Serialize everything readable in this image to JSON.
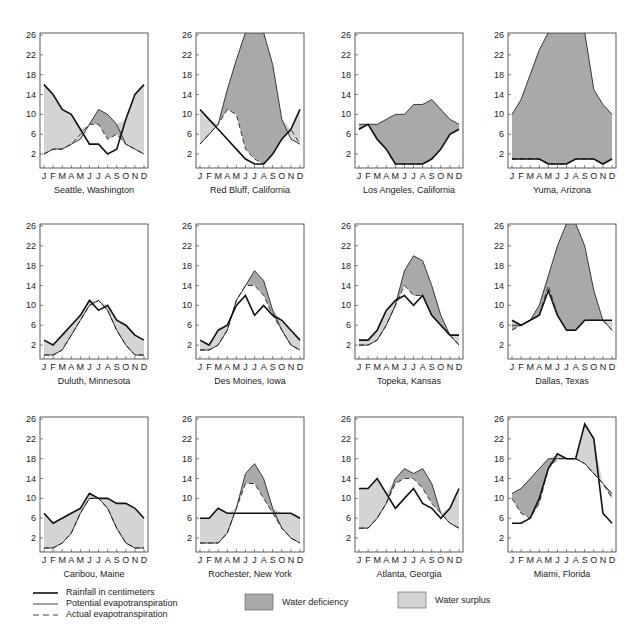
{
  "chart_data": {
    "type": "line",
    "x": [
      "J",
      "F",
      "M",
      "A",
      "M",
      "J",
      "J",
      "A",
      "S",
      "O",
      "N",
      "D"
    ],
    "ylim": [
      0,
      26
    ],
    "yticks": [
      2,
      6,
      10,
      14,
      18,
      22,
      26
    ],
    "legend": {
      "rainfall": "Rainfall in centimeters",
      "potential": "Potential evapotranspiration",
      "actual": "Actual evapotranspiration",
      "deficiency": "Water deficiency",
      "surplus": "Water surplus"
    },
    "colors": {
      "deficiency": "#a9a9a9",
      "surplus": "#d4d4d4",
      "line": "#111111"
    },
    "panels": [
      {
        "name": "Seattle, Washington",
        "rainfall": [
          16,
          14,
          11,
          10,
          7,
          4,
          4,
          2,
          3,
          9,
          14,
          16
        ],
        "potential": [
          2,
          3,
          3,
          4,
          5,
          8,
          11,
          10,
          8,
          4,
          3,
          2
        ],
        "actual": [
          2,
          3,
          3,
          4,
          6,
          8,
          8,
          5,
          6,
          4,
          3,
          2
        ]
      },
      {
        "name": "Red Bluff, California",
        "rainfall": [
          11,
          9,
          7,
          5,
          3,
          1,
          0,
          0,
          2,
          5,
          7,
          11
        ],
        "potential": [
          4,
          6,
          8,
          15,
          21,
          29,
          30,
          28,
          20,
          9,
          5,
          4
        ],
        "actual": [
          4,
          6,
          8,
          11,
          10,
          3,
          1,
          0,
          2,
          5,
          7,
          4
        ]
      },
      {
        "name": "Los Angeles, California",
        "rainfall": [
          7,
          8,
          5,
          3,
          0,
          0,
          0,
          0,
          1,
          3,
          6,
          7
        ],
        "potential": [
          8,
          8,
          8,
          9,
          10,
          10,
          12,
          12,
          13,
          11,
          9,
          8
        ],
        "actual": [
          7,
          8,
          5,
          3,
          0,
          0,
          0,
          0,
          1,
          3,
          6,
          7
        ]
      },
      {
        "name": "Yuma, Arizona",
        "rainfall": [
          1,
          1,
          1,
          1,
          0,
          0,
          0,
          1,
          1,
          1,
          0,
          1
        ],
        "potential": [
          10,
          13,
          18,
          23,
          28,
          32,
          34,
          32,
          28,
          15,
          12,
          10
        ],
        "actual": [
          1,
          1,
          1,
          1,
          0,
          0,
          0,
          1,
          1,
          1,
          0,
          1
        ]
      },
      {
        "name": "Duluth, Minnesota",
        "rainfall": [
          3,
          2,
          4,
          6,
          8,
          11,
          9,
          10,
          7,
          6,
          4,
          3
        ],
        "potential": [
          0,
          0,
          1,
          4,
          7,
          10,
          11,
          9,
          5,
          2,
          0,
          0
        ],
        "actual": [
          0,
          0,
          1,
          4,
          7,
          10,
          11,
          9,
          5,
          2,
          0,
          0
        ]
      },
      {
        "name": "Des Moines, Iowa",
        "rainfall": [
          3,
          2,
          5,
          6,
          10,
          12,
          8,
          10,
          8,
          7,
          5,
          3
        ],
        "potential": [
          1,
          1,
          2,
          5,
          11,
          14,
          17,
          15,
          9,
          5,
          2,
          1
        ],
        "actual": [
          1,
          1,
          2,
          5,
          11,
          14,
          14,
          12,
          8,
          5,
          2,
          1
        ]
      },
      {
        "name": "Topeka, Kansas",
        "rainfall": [
          3,
          3,
          5,
          9,
          11,
          12,
          10,
          12,
          8,
          6,
          4,
          4
        ],
        "potential": [
          2,
          2,
          3,
          6,
          10,
          17,
          20,
          19,
          14,
          8,
          4,
          2
        ],
        "actual": [
          2,
          2,
          3,
          6,
          10,
          14,
          12,
          12,
          8,
          6,
          4,
          2
        ]
      },
      {
        "name": "Dallas, Texas",
        "rainfall": [
          7,
          6,
          7,
          8,
          13,
          8,
          5,
          5,
          7,
          7,
          7,
          7
        ],
        "potential": [
          6,
          6,
          7,
          10,
          16,
          22,
          28,
          28,
          22,
          13,
          7,
          5
        ],
        "actual": [
          5,
          6,
          7,
          8,
          14,
          8,
          5,
          5,
          7,
          7,
          7,
          5
        ]
      },
      {
        "name": "Caribou, Maine",
        "rainfall": [
          7,
          5,
          6,
          7,
          8,
          11,
          10,
          10,
          9,
          9,
          8,
          6
        ],
        "potential": [
          0,
          0,
          1,
          3,
          7,
          10,
          10,
          8,
          4,
          1,
          0,
          0
        ],
        "actual": [
          0,
          0,
          1,
          3,
          7,
          10,
          10,
          8,
          4,
          1,
          0,
          0
        ]
      },
      {
        "name": "Rochester, New York",
        "rainfall": [
          6,
          6,
          8,
          7,
          7,
          7,
          7,
          7,
          7,
          7,
          7,
          6
        ],
        "potential": [
          1,
          1,
          1,
          3,
          8,
          15,
          17,
          14,
          8,
          4,
          2,
          1
        ],
        "actual": [
          1,
          1,
          1,
          3,
          8,
          13,
          13,
          10,
          7,
          4,
          2,
          1
        ]
      },
      {
        "name": "Atlanta, Georgia",
        "rainfall": [
          12,
          12,
          14,
          11,
          8,
          10,
          12,
          9,
          8,
          6,
          8,
          12
        ],
        "potential": [
          4,
          4,
          6,
          9,
          14,
          16,
          15,
          16,
          13,
          7,
          5,
          4
        ],
        "actual": [
          4,
          4,
          6,
          9,
          13,
          14,
          14,
          12,
          9,
          7,
          5,
          4
        ]
      },
      {
        "name": "Miami, Florida",
        "rainfall": [
          5,
          5,
          6,
          10,
          16,
          19,
          18,
          18,
          25,
          22,
          7,
          5
        ],
        "potential": [
          11,
          12,
          14,
          16,
          18,
          18,
          18,
          18,
          17,
          15,
          13,
          11
        ],
        "actual": [
          10,
          7,
          6,
          9,
          16,
          18,
          18,
          18,
          17,
          15,
          13,
          10
        ]
      }
    ]
  }
}
